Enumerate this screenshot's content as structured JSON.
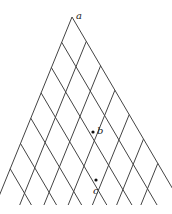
{
  "diagram": {
    "apex": [
      72,
      17
    ],
    "left_step": [
      -10.3,
      25.3
    ],
    "right_step": [
      14.3,
      24.4
    ],
    "lines_per_direction": 7,
    "bottom_y": 205,
    "line_color": "#444444",
    "points": [
      {
        "name": "a",
        "label": "a",
        "x": 72,
        "y": 17,
        "lx": 76,
        "ly": 11,
        "dot": false
      },
      {
        "name": "b",
        "label": "b",
        "x": 93,
        "y": 132,
        "lx": 97,
        "ly": 126,
        "dot": true
      },
      {
        "name": "c",
        "label": "c",
        "x": 96,
        "y": 180,
        "lx": 93,
        "ly": 186,
        "dot": true
      }
    ]
  }
}
